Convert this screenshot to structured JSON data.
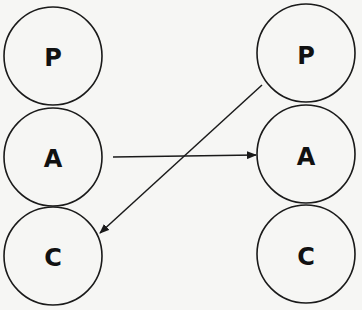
{
  "diagram": {
    "left_column": {
      "nodes": [
        {
          "id": "P",
          "label": "P"
        },
        {
          "id": "A",
          "label": "A"
        },
        {
          "id": "C",
          "label": "C"
        }
      ]
    },
    "right_column": {
      "nodes": [
        {
          "id": "P",
          "label": "P"
        },
        {
          "id": "A",
          "label": "A"
        },
        {
          "id": "C",
          "label": "C"
        }
      ]
    },
    "edges": [
      {
        "from": "left.A",
        "to": "right.A"
      },
      {
        "from": "right.P",
        "to": "left.C"
      }
    ],
    "colors": {
      "stroke": "#1a1a1a",
      "background": "#f6f6f4"
    }
  }
}
